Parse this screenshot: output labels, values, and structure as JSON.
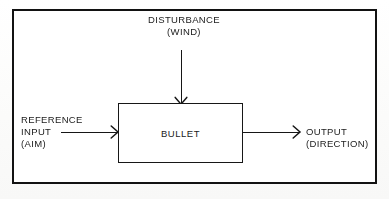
{
  "diagram": {
    "title_block": {
      "label": "BULLET"
    },
    "disturbance": {
      "line1": "DISTURBANCE",
      "line2": "(WIND)",
      "arrow_icon": "arrow-down-icon"
    },
    "reference_input": {
      "line1": "REFERENCE",
      "line2": "INPUT",
      "line3": "(AIM)",
      "arrow_icon": "arrow-right-icon"
    },
    "output": {
      "line1": "OUTPUT",
      "line2": "(DIRECTION)",
      "arrow_icon": "arrow-right-icon"
    },
    "colors": {
      "stroke": "#161616",
      "frame": "#121212",
      "text": "#1b1b1b",
      "background": "#ffffff"
    }
  }
}
